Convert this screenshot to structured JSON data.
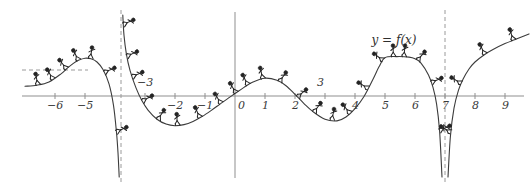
{
  "figure": {
    "name": "graph-of-f",
    "curve_label": "y = f(x)",
    "stroke_color": "#3c3c3c",
    "axis_color": "#8a8a8a",
    "dash_color": "#9a9a9a",
    "background": "#ffffff"
  },
  "axes": {
    "x_label_values": [
      "-6",
      "-5",
      "-3",
      "-2",
      "-1",
      "0",
      "1",
      "2",
      "3",
      "4",
      "5",
      "6",
      "7",
      "8",
      "9"
    ],
    "x_min": -7,
    "x_max": 10,
    "x_origin_px": 235,
    "x_unit_px": 30,
    "y_axis_px": 235,
    "x_axis_px": 96,
    "tick_size_px": 4
  },
  "asymptotes": {
    "vertical": [
      "-3.8",
      "7"
    ],
    "horizontal_left": "y = c"
  },
  "chart_data": {
    "type": "line",
    "title": "",
    "xlabel": "",
    "ylabel": "",
    "xlim": [
      -7,
      10
    ],
    "ylim": [
      -3.1,
      2.9
    ],
    "grid": false,
    "legend": "none",
    "annotations": [
      {
        "text": "y = f(x)",
        "x": 5.0,
        "y": 2.05
      },
      {
        "text": "-3",
        "x": -3.0,
        "y": 0.35
      },
      {
        "text": "3",
        "x": 3.0,
        "y": 0.35
      }
    ],
    "xticks": [
      -6,
      -5,
      -3,
      -2,
      -1,
      0,
      1,
      2,
      3,
      4,
      5,
      6,
      7,
      8,
      9
    ],
    "xticklabels": [
      "-6",
      "-5",
      "-3",
      "-2",
      "-1",
      "0",
      "1",
      "2",
      "3",
      "4",
      "5",
      "6",
      "7",
      "8",
      "9"
    ],
    "vertical_asymptotes": [
      -3.8,
      7.0
    ],
    "horizontal_asymptote_left": 0.33,
    "series": [
      {
        "name": "f(x) branch 1 (left of x=-3.8)",
        "x": [
          -7.0,
          -6.6,
          -6.2,
          -5.8,
          -5.6,
          -5.4,
          -5.2,
          -5.0,
          -4.8,
          -4.6,
          -4.4,
          -4.2,
          -4.05,
          -3.95,
          -3.9,
          -3.86
        ],
        "y": [
          0.36,
          0.4,
          0.52,
          0.82,
          1.02,
          1.2,
          1.33,
          1.4,
          1.38,
          1.26,
          0.98,
          0.45,
          -0.35,
          -1.35,
          -2.1,
          -3.0
        ]
      },
      {
        "name": "f(x) branch 2 (x=-3.74 to x=7)",
        "x": [
          -3.74,
          -3.7,
          -3.62,
          -3.5,
          -3.3,
          -3.1,
          -2.9,
          -2.6,
          -2.3,
          -2.0,
          -1.7,
          -1.4,
          -1.1,
          -0.8,
          -0.5,
          -0.2,
          0.0,
          0.3,
          0.6,
          1.0,
          1.4,
          1.7,
          2.0,
          2.3,
          2.6,
          3.0,
          3.4,
          3.7,
          4.0,
          4.3,
          4.6,
          4.8,
          5.0,
          5.4,
          5.8,
          6.0,
          6.2,
          6.45,
          6.6,
          6.72,
          6.82,
          6.9
        ],
        "y": [
          3.0,
          2.25,
          1.55,
          0.95,
          0.3,
          -0.18,
          -0.52,
          -0.86,
          -1.04,
          -1.1,
          -1.06,
          -0.94,
          -0.76,
          -0.54,
          -0.3,
          -0.06,
          0.09,
          0.32,
          0.52,
          0.66,
          0.58,
          0.38,
          0.06,
          -0.28,
          -0.58,
          -0.86,
          -0.92,
          -0.78,
          -0.47,
          -0.02,
          0.62,
          1.08,
          1.42,
          1.46,
          1.44,
          1.38,
          1.22,
          0.78,
          0.32,
          -0.3,
          -1.3,
          -3.0
        ]
      },
      {
        "name": "f(x) branch 3 (right of x=7)",
        "x": [
          7.1,
          7.18,
          7.3,
          7.45,
          7.6,
          7.8,
          8.0,
          8.3,
          8.6,
          9.0,
          9.4,
          9.8
        ],
        "y": [
          -3.0,
          -1.5,
          -0.45,
          0.22,
          0.62,
          1.0,
          1.26,
          1.52,
          1.72,
          1.94,
          2.12,
          2.3
        ]
      }
    ]
  },
  "climbers": {
    "count": 34,
    "description": "stick figures climbing along the curve",
    "positions": [
      {
        "x": -6.55,
        "dir": 1
      },
      {
        "x": -6.05,
        "dir": 1
      },
      {
        "x": -5.6,
        "dir": 1
      },
      {
        "x": -5.2,
        "dir": 1
      },
      {
        "x": -4.8,
        "dir": 1
      },
      {
        "x": -4.35,
        "dir": 1
      },
      {
        "x": -3.95,
        "dir": 1
      },
      {
        "x": -3.72,
        "dir": 1
      },
      {
        "x": -3.6,
        "dir": 1
      },
      {
        "x": -3.42,
        "dir": 1
      },
      {
        "x": -3.08,
        "dir": 1
      },
      {
        "x": -2.55,
        "dir": 1
      },
      {
        "x": -1.9,
        "dir": 1
      },
      {
        "x": -1.15,
        "dir": 1
      },
      {
        "x": -0.45,
        "dir": 1
      },
      {
        "x": 0.05,
        "dir": 1
      },
      {
        "x": 0.45,
        "dir": 1
      },
      {
        "x": 0.95,
        "dir": 1
      },
      {
        "x": 1.5,
        "dir": 1
      },
      {
        "x": 2.1,
        "dir": 1
      },
      {
        "x": 2.65,
        "dir": 1
      },
      {
        "x": 3.25,
        "dir": 1
      },
      {
        "x": 3.85,
        "dir": 1
      },
      {
        "x": 4.45,
        "dir": 1
      },
      {
        "x": 4.95,
        "dir": 1
      },
      {
        "x": 5.3,
        "dir": 1
      },
      {
        "x": 5.65,
        "dir": 1
      },
      {
        "x": 6.1,
        "dir": 1
      },
      {
        "x": 6.55,
        "dir": 1
      },
      {
        "x": 6.82,
        "dir": 1
      },
      {
        "x": 7.2,
        "dir": 1
      },
      {
        "x": 7.55,
        "dir": 1
      },
      {
        "x": 8.35,
        "dir": 1
      },
      {
        "x": 9.3,
        "dir": 1
      }
    ]
  }
}
